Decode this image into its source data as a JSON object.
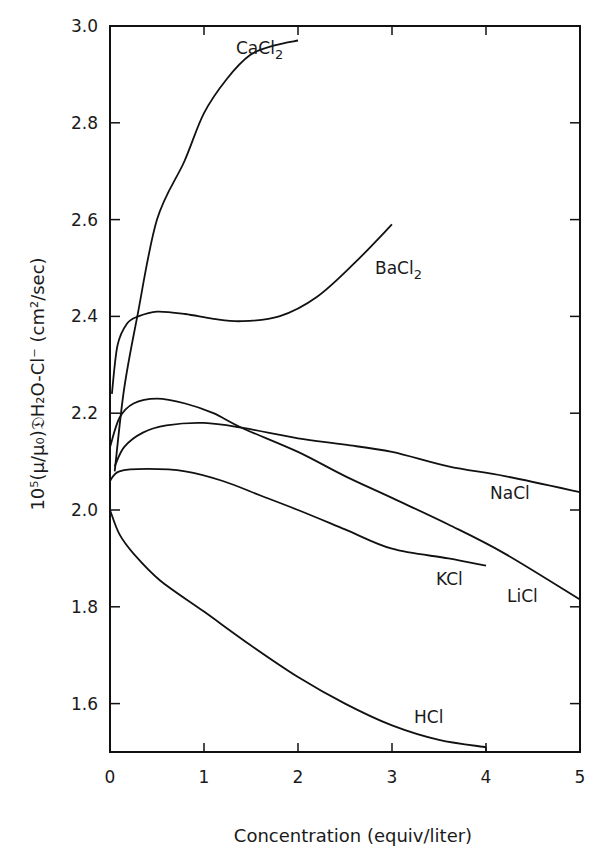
{
  "chart_data": {
    "type": "line",
    "title": "",
    "xlabel": "Concentration  (equiv/liter)",
    "ylabel": "10⁵(μ/μ₀)𝔇H₂O-Cl⁻  (cm²/sec)",
    "xlim": [
      0,
      5
    ],
    "ylim": [
      1.5,
      3.0
    ],
    "xticks": [
      "0",
      "1",
      "2",
      "3",
      "4",
      "5"
    ],
    "yticks": [
      "1.6",
      "1.8",
      "2.0",
      "2.2",
      "2.4",
      "2.6",
      "2.8",
      "3.0"
    ],
    "grid": false,
    "legend": "inline labels",
    "series": [
      {
        "name": "CaCl2",
        "label_main": "CaCl",
        "label_sub": "2",
        "x": [
          0.05,
          0.15,
          0.29,
          0.5,
          0.79,
          1.0,
          1.24,
          1.49,
          1.75,
          2.0
        ],
        "y": [
          2.08,
          2.25,
          2.4,
          2.6,
          2.72,
          2.82,
          2.89,
          2.94,
          2.96,
          2.97
        ]
      },
      {
        "name": "BaCl2",
        "label_main": "BaCl",
        "label_sub": "2",
        "x": [
          0.02,
          0.08,
          0.18,
          0.3,
          0.5,
          0.8,
          1.1,
          1.4,
          1.8,
          2.2,
          2.6,
          3.0
        ],
        "y": [
          2.24,
          2.34,
          2.385,
          2.4,
          2.41,
          2.405,
          2.395,
          2.39,
          2.4,
          2.44,
          2.51,
          2.59
        ]
      },
      {
        "name": "LiCl",
        "label_main": "LiCl",
        "label_sub": "",
        "x": [
          0.0,
          0.1,
          0.25,
          0.5,
          0.8,
          1.1,
          1.4,
          2.0,
          2.5,
          3.0,
          3.6,
          4.2,
          5.0
        ],
        "y": [
          2.13,
          2.19,
          2.22,
          2.23,
          2.22,
          2.2,
          2.17,
          2.12,
          2.07,
          2.025,
          1.97,
          1.91,
          1.815
        ]
      },
      {
        "name": "NaCl",
        "label_main": "NaCl",
        "label_sub": "",
        "x": [
          0.05,
          0.15,
          0.35,
          0.6,
          1.0,
          1.4,
          2.0,
          2.5,
          3.0,
          3.6,
          4.2,
          5.0
        ],
        "y": [
          2.09,
          2.13,
          2.16,
          2.175,
          2.18,
          2.17,
          2.148,
          2.135,
          2.12,
          2.09,
          2.07,
          2.037
        ]
      },
      {
        "name": "KCl",
        "label_main": "KCl",
        "label_sub": "",
        "x": [
          0.0,
          0.1,
          0.4,
          0.8,
          1.2,
          1.6,
          2.0,
          2.5,
          3.0,
          3.6,
          4.0
        ],
        "y": [
          2.06,
          2.08,
          2.085,
          2.08,
          2.06,
          2.03,
          2.0,
          1.96,
          1.92,
          1.9,
          1.885
        ]
      },
      {
        "name": "HCl",
        "label_main": "HCl",
        "label_sub": "",
        "x": [
          0.0,
          0.1,
          0.25,
          0.53,
          1.0,
          1.5,
          2.0,
          2.5,
          3.0,
          3.5,
          4.0
        ],
        "y": [
          2.0,
          1.95,
          1.91,
          1.855,
          1.79,
          1.72,
          1.655,
          1.6,
          1.555,
          1.525,
          1.51
        ]
      }
    ]
  }
}
